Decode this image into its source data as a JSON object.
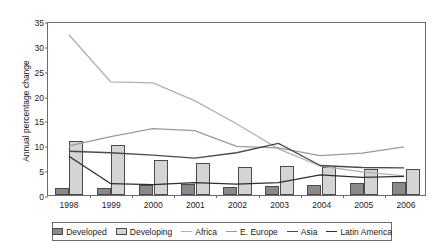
{
  "chart_data": {
    "type": "line",
    "title": "",
    "xlabel": "",
    "ylabel": "Annual percentage change",
    "categories": [
      "1998",
      "1999",
      "2000",
      "2001",
      "2002",
      "2003",
      "2004",
      "2005",
      "2006"
    ],
    "ylim": [
      0,
      35
    ],
    "ytick_step": 5,
    "yticks": [
      "0",
      "5",
      "10",
      "15",
      "20",
      "25",
      "30",
      "35"
    ],
    "grid": false,
    "legend_position": "bottom",
    "bar_series": [
      {
        "name": "Developed",
        "kind": "bar",
        "color": "#8a8a8a",
        "values": [
          1.5,
          1.4,
          2.1,
          2.2,
          1.6,
          1.9,
          2.1,
          2.4,
          2.7
        ]
      },
      {
        "name": "Developing",
        "kind": "bar",
        "color": "#d4d4d4",
        "values": [
          10.9,
          10.0,
          7.1,
          6.5,
          5.7,
          5.8,
          5.6,
          5.3,
          5.2
        ]
      }
    ],
    "line_series": [
      {
        "name": "Africa",
        "kind": "line",
        "color": "#b0b0b0",
        "values": [
          32.6,
          23.0,
          22.8,
          19.2,
          14.5,
          9.4,
          5.9,
          4.7,
          3.9
        ]
      },
      {
        "name": "E. Europe",
        "kind": "line",
        "color": "#9a9a9a",
        "values": [
          10.0,
          11.9,
          13.5,
          13.1,
          9.9,
          9.6,
          8.0,
          8.5,
          9.8
        ]
      },
      {
        "name": "Asia",
        "kind": "line",
        "color": "#4a4a4a",
        "values": [
          8.9,
          8.6,
          8.1,
          7.5,
          8.6,
          10.5,
          6.0,
          5.6,
          5.5
        ]
      },
      {
        "name": "Latin America",
        "kind": "line",
        "color": "#2e2e2e",
        "values": [
          7.9,
          2.3,
          2.1,
          2.5,
          2.2,
          2.5,
          4.1,
          3.6,
          3.8
        ]
      }
    ]
  },
  "legend": {
    "items": [
      {
        "label": "Developed",
        "marker": "box-developed"
      },
      {
        "label": "Developing",
        "marker": "box-developing"
      },
      {
        "label": "Africa",
        "marker": "line-africa"
      },
      {
        "label": "E. Europe",
        "marker": "line-eeurope"
      },
      {
        "label": "Asia",
        "marker": "line-asia"
      },
      {
        "label": "Latin America",
        "marker": "line-latinamerica"
      }
    ]
  }
}
